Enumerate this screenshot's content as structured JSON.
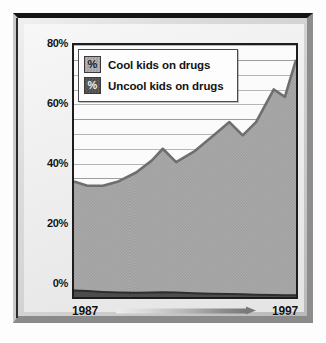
{
  "chart_data": {
    "type": "area",
    "title": "",
    "xlabel": "",
    "ylabel": "",
    "grid": true,
    "legend_position": "top-left",
    "xlim": [
      1987,
      1997
    ],
    "ylim": [
      0,
      85
    ],
    "x_tick_labels": [
      "1987",
      "1997"
    ],
    "y_tick_labels": [
      "0%",
      "20%",
      "40%",
      "60%",
      "80%"
    ],
    "y_ticks": [
      0,
      20,
      40,
      60,
      80
    ],
    "x": [
      1987,
      1987.6,
      1988.3,
      1989,
      1989.8,
      1990.5,
      1991,
      1991.6,
      1992.4,
      1993.2,
      1994,
      1994.6,
      1995.2,
      1996,
      1996.5,
      1997
    ],
    "series": [
      {
        "name": "Cool kids on drugs",
        "color": "#a8a8a8",
        "line_color": "#6e6e6e",
        "values": [
          39,
          37.5,
          37.5,
          39,
          42,
          46,
          50,
          45.5,
          49,
          54,
          59,
          54.5,
          59,
          70,
          67.5,
          80
        ]
      },
      {
        "name": "Uncool kids on drugs",
        "color": "#4f4f4f",
        "line_color": "#2e2e2e",
        "values": [
          2.2,
          2.0,
          1.7,
          1.5,
          1.4,
          1.5,
          1.6,
          1.5,
          1.3,
          1.1,
          1.0,
          0.9,
          0.8,
          0.7,
          0.6,
          0.6
        ]
      }
    ]
  },
  "frame": {
    "style": "beveled-gray-border"
  },
  "legend": {
    "items": [
      {
        "label": "Cool kids on drugs",
        "swatch": "pattern-light-gray",
        "glyph": "%"
      },
      {
        "label": "Uncool kids on drugs",
        "swatch": "pattern-dark-gray",
        "glyph": "%"
      }
    ]
  },
  "yaxis": {
    "ticks": [
      {
        "label": "80%",
        "value": 80
      },
      {
        "label": "60%",
        "value": 60
      },
      {
        "label": "40%",
        "value": 40
      },
      {
        "label": "20%",
        "value": 20
      },
      {
        "label": "0%",
        "value": 0
      }
    ]
  },
  "xaxis": {
    "start_label": "1987",
    "end_label": "1997",
    "arrow": "right-arrow-icon"
  }
}
